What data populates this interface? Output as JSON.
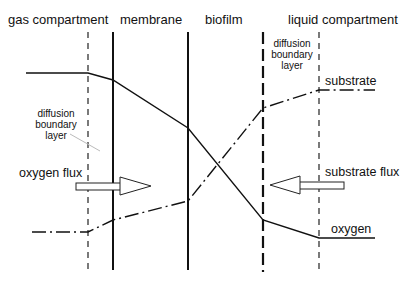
{
  "headers": {
    "gas": "gas compartment",
    "membrane": "membrane",
    "biofilm": "biofilm",
    "liquid": "liquid compartment"
  },
  "dbl_left": [
    "diffusion",
    "boundary",
    "layer"
  ],
  "dbl_right": [
    "diffusion",
    "boundary",
    "layer"
  ],
  "labels": {
    "substrate": "substrate",
    "oxygen": "oxygen",
    "oxygen_flux": "oxygen flux",
    "substrate_flux": "substrate flux"
  },
  "profiles": {
    "oxygen": {
      "style": "solid",
      "points": [
        [
          26,
          73
        ],
        [
          88,
          73
        ],
        [
          113,
          80
        ],
        [
          188,
          128
        ],
        [
          263,
          220
        ],
        [
          319,
          238
        ],
        [
          375,
          238
        ]
      ]
    },
    "substrate": {
      "style": "dash-dot",
      "points": [
        [
          32,
          232
        ],
        [
          88,
          232
        ],
        [
          113,
          220
        ],
        [
          188,
          201
        ],
        [
          263,
          108
        ],
        [
          319,
          90
        ],
        [
          375,
          90
        ]
      ]
    }
  },
  "colors": {
    "line": "#111111",
    "background": "#ffffff"
  }
}
